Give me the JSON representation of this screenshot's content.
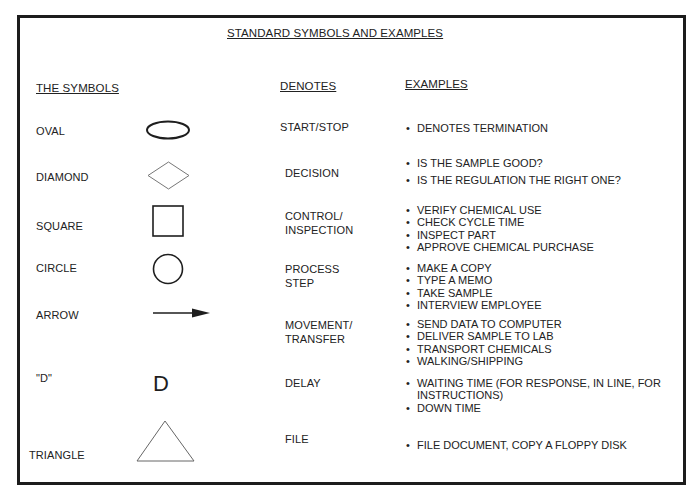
{
  "title": "STANDARD SYMBOLS AND EXAMPLES",
  "headers": {
    "symbols": "THE SYMBOLS",
    "denotes": "DENOTES",
    "examples": "EXAMPLES"
  },
  "rows": [
    {
      "symbol": "OVAL",
      "shape": "oval-icon",
      "denotes": "START/STOP",
      "examples": [
        "DENOTES TERMINATION"
      ]
    },
    {
      "symbol": "DIAMOND",
      "shape": "diamond-icon",
      "denotes": "DECISION",
      "examples": [
        "IS THE SAMPLE GOOD?",
        "IS THE REGULATION THE RIGHT ONE?"
      ]
    },
    {
      "symbol": "SQUARE",
      "shape": "square-icon",
      "denotes": "CONTROL/\nINSPECTION",
      "denotes_lines": [
        "CONTROL/",
        "INSPECTION"
      ],
      "examples": [
        "VERIFY CHEMICAL USE",
        "CHECK CYCLE TIME",
        "INSPECT PART",
        "APPROVE CHEMICAL PURCHASE"
      ]
    },
    {
      "symbol": "CIRCLE",
      "shape": "circle-icon",
      "denotes_lines": [
        "PROCESS",
        "STEP"
      ],
      "examples": [
        "MAKE A COPY",
        "TYPE A MEMO",
        "TAKE SAMPLE",
        "INTERVIEW EMPLOYEE"
      ]
    },
    {
      "symbol": "ARROW",
      "shape": "arrow-icon",
      "denotes_lines": [
        "MOVEMENT/",
        "TRANSFER"
      ],
      "examples": [
        "SEND DATA TO COMPUTER",
        "DELIVER SAMPLE TO LAB",
        "TRANSPORT CHEMICALS",
        "WALKING/SHIPPING"
      ]
    },
    {
      "symbol": "\"D\"",
      "shape": "d-letter-icon",
      "glyph": "D",
      "denotes": "DELAY",
      "examples": [
        "WAITING TIME (FOR RESPONSE, IN LINE, FOR INSTRUCTIONS)",
        "DOWN TIME"
      ]
    },
    {
      "symbol": "TRIANGLE",
      "shape": "triangle-icon",
      "denotes": "FILE",
      "examples": [
        "FILE DOCUMENT, COPY A FLOPPY DISK"
      ]
    }
  ]
}
